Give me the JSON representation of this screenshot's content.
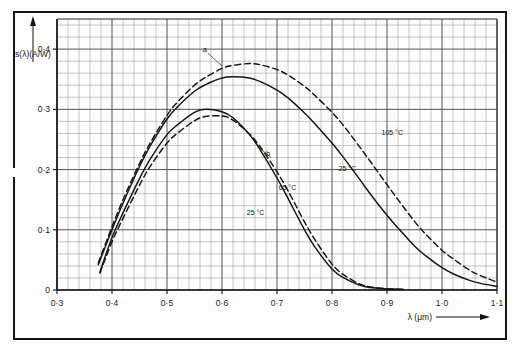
{
  "figure": {
    "background": "#fdfdfc",
    "frame_color": "#161616"
  },
  "chart_data": {
    "type": "line",
    "title": "",
    "xlabel": "λ (μm)",
    "ylabel": "s(λ)(A/W)",
    "xlim": [
      0.3,
      1.1
    ],
    "ylim": [
      0.0,
      0.45
    ],
    "grid": true,
    "grid_major_step_x": 0.1,
    "grid_minor_divisions_x": 5,
    "grid_major_step_y": 0.1,
    "grid_minor_divisions_y": 5,
    "legend_position": "inline-annotations",
    "xticks": [
      0.3,
      0.4,
      0.5,
      0.6,
      0.7,
      0.8,
      0.9,
      1.0,
      1.1
    ],
    "xticklabels": [
      "0·3",
      "0·4",
      "0·5",
      "0·6",
      "0·7",
      "0·8",
      "0·9",
      "1·0",
      "1·1"
    ],
    "yticks": [
      0.0,
      0.1,
      0.2,
      0.3,
      0.4
    ],
    "yticklabels": [
      "0",
      "0·1",
      "0·2",
      "0·3",
      "0·4"
    ],
    "series": [
      {
        "name": "a-105C",
        "label": "105 °C",
        "group": "a",
        "style": "dashed",
        "color": "#141414",
        "x": [
          0.375,
          0.4,
          0.42,
          0.45,
          0.47,
          0.5,
          0.52,
          0.55,
          0.57,
          0.6,
          0.62,
          0.65,
          0.67,
          0.7,
          0.72,
          0.75,
          0.77,
          0.8,
          0.82,
          0.85,
          0.87,
          0.9,
          0.92,
          0.95,
          0.97,
          1.0,
          1.02,
          1.05,
          1.07,
          1.1
        ],
        "values": [
          0.045,
          0.105,
          0.15,
          0.21,
          0.245,
          0.29,
          0.313,
          0.34,
          0.353,
          0.368,
          0.373,
          0.376,
          0.374,
          0.366,
          0.357,
          0.338,
          0.322,
          0.295,
          0.274,
          0.238,
          0.213,
          0.175,
          0.15,
          0.114,
          0.093,
          0.066,
          0.052,
          0.033,
          0.024,
          0.013
        ]
      },
      {
        "name": "a-25C",
        "label": "25 °C",
        "group": "a",
        "style": "solid",
        "color": "#141414",
        "x": [
          0.375,
          0.4,
          0.42,
          0.45,
          0.47,
          0.5,
          0.52,
          0.55,
          0.57,
          0.6,
          0.62,
          0.65,
          0.67,
          0.7,
          0.72,
          0.75,
          0.77,
          0.8,
          0.82,
          0.85,
          0.87,
          0.9,
          0.92,
          0.95,
          0.97,
          1.0,
          1.02,
          1.05,
          1.07,
          1.1
        ],
        "values": [
          0.042,
          0.1,
          0.144,
          0.205,
          0.24,
          0.284,
          0.305,
          0.33,
          0.341,
          0.352,
          0.354,
          0.352,
          0.346,
          0.332,
          0.319,
          0.294,
          0.275,
          0.244,
          0.221,
          0.184,
          0.159,
          0.124,
          0.103,
          0.073,
          0.057,
          0.037,
          0.027,
          0.016,
          0.011,
          0.006
        ]
      },
      {
        "name": "b-25C",
        "label": "25 °C",
        "group": "b",
        "style": "solid",
        "color": "#141414",
        "x": [
          0.378,
          0.4,
          0.42,
          0.45,
          0.47,
          0.5,
          0.52,
          0.55,
          0.57,
          0.6,
          0.62,
          0.65,
          0.67,
          0.7,
          0.72,
          0.75,
          0.77,
          0.8,
          0.82,
          0.85,
          0.87,
          0.9,
          0.93
        ],
        "values": [
          0.03,
          0.087,
          0.128,
          0.185,
          0.218,
          0.258,
          0.275,
          0.295,
          0.3,
          0.296,
          0.286,
          0.258,
          0.232,
          0.186,
          0.152,
          0.1,
          0.07,
          0.035,
          0.021,
          0.008,
          0.004,
          0.002,
          0.001
        ]
      },
      {
        "name": "b-65C",
        "label": "65 °C",
        "group": "b",
        "style": "dashed",
        "color": "#141414",
        "x": [
          0.378,
          0.4,
          0.42,
          0.45,
          0.47,
          0.5,
          0.52,
          0.55,
          0.57,
          0.6,
          0.62,
          0.65,
          0.67,
          0.7,
          0.72,
          0.75,
          0.77,
          0.8,
          0.82,
          0.85,
          0.87,
          0.9,
          0.93
        ],
        "values": [
          0.028,
          0.08,
          0.119,
          0.174,
          0.206,
          0.244,
          0.261,
          0.281,
          0.288,
          0.289,
          0.282,
          0.259,
          0.237,
          0.196,
          0.165,
          0.113,
          0.082,
          0.043,
          0.026,
          0.01,
          0.005,
          0.002,
          0.001
        ]
      }
    ],
    "annotations": [
      {
        "name": "curve-a-callout",
        "text": "a",
        "x": 0.565,
        "y": 0.395,
        "leader_to_x": 0.6,
        "leader_to_y": 0.372
      },
      {
        "name": "curve-b-callout",
        "text": "b",
        "x": 0.68,
        "y": 0.222,
        "leader_to_x": 0.665,
        "leader_to_y": 0.238
      },
      {
        "name": "label-a-105c",
        "text": "105 °C",
        "x": 0.89,
        "y": 0.258
      },
      {
        "name": "label-a-25c",
        "text": "25 °C",
        "x": 0.812,
        "y": 0.198
      },
      {
        "name": "label-b-65c",
        "text": "65 °C",
        "x": 0.703,
        "y": 0.166
      },
      {
        "name": "label-b-25c",
        "text": "25 °C",
        "x": 0.645,
        "y": 0.124
      }
    ]
  }
}
